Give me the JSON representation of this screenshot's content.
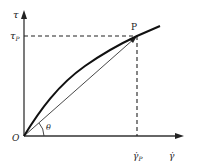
{
  "diagram": {
    "y_axis_label": "τ",
    "y_tick_label": "τ",
    "y_tick_sub": "P",
    "x_axis_label": "γ̇",
    "x_tick_label": "γ̇",
    "x_tick_sub": "P",
    "point_label": "P",
    "origin_label": "O",
    "angle_label": "θ"
  }
}
